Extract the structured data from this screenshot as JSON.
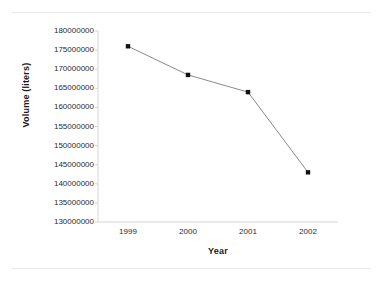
{
  "chart_data": {
    "type": "line",
    "title": "",
    "subtitle": "",
    "xlabel": "Year",
    "ylabel": "Volume (liters)",
    "categories": [
      "1999",
      "2000",
      "2001",
      "2002"
    ],
    "x": [
      1999,
      2000,
      2001,
      2002
    ],
    "values": [
      176000000,
      168500000,
      164000000,
      143000000
    ],
    "series": [
      {
        "name": "Volume",
        "values": [
          176000000,
          168500000,
          164000000,
          143000000
        ]
      }
    ],
    "ylim": [
      130000000,
      180000000
    ],
    "ytick_labels": [
      "180000000",
      "175000000",
      "170000000",
      "165000000",
      "160000000",
      "155000000",
      "150000000",
      "145000000",
      "140000000",
      "135000000",
      "130000000"
    ],
    "yticks": [
      180000000,
      175000000,
      170000000,
      165000000,
      160000000,
      155000000,
      150000000,
      145000000,
      140000000,
      135000000,
      130000000
    ],
    "xtick_labels": [
      "1999",
      "2000",
      "2001",
      "2002"
    ],
    "grid": false,
    "legend": "none",
    "marker": "square",
    "marker_color": "#111111",
    "line_color": "#8a8a8a",
    "axis_color": "#d5d5d8",
    "background_color": "#ffffff",
    "annotations": []
  }
}
